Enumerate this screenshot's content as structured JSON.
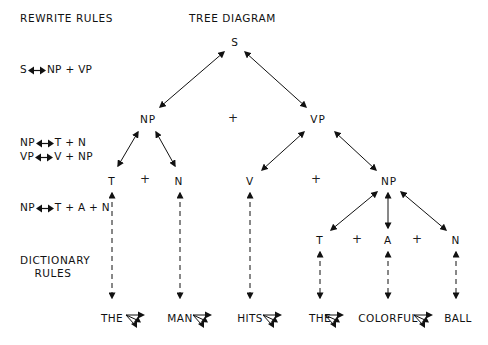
{
  "headers": {
    "rewrite_rules": "REWRITE RULES",
    "tree_diagram": "TREE DIAGRAM",
    "dictionary_rules_line1": "DICTIONARY",
    "dictionary_rules_line2": "RULES"
  },
  "rewrite_rules": [
    {
      "lhs": "S",
      "rhs": "NP + VP",
      "y": 70
    },
    {
      "lhs": "NP",
      "rhs": "T + N",
      "y": 143
    },
    {
      "lhs": "VP",
      "rhs": "V + NP",
      "y": 157
    },
    {
      "lhs": "NP",
      "rhs": "T + A + N",
      "y": 208
    }
  ],
  "tree": {
    "nodes": [
      {
        "id": "S",
        "label": "S",
        "x": 235,
        "y": 42
      },
      {
        "id": "NP1",
        "label": "NP",
        "x": 148,
        "y": 119
      },
      {
        "id": "VP",
        "label": "VP",
        "x": 318,
        "y": 119
      },
      {
        "id": "T1",
        "label": "T",
        "x": 112,
        "y": 181
      },
      {
        "id": "N1",
        "label": "N",
        "x": 179,
        "y": 181
      },
      {
        "id": "V",
        "label": "V",
        "x": 250,
        "y": 181
      },
      {
        "id": "NP2",
        "label": "NP",
        "x": 389,
        "y": 181
      },
      {
        "id": "T2",
        "label": "T",
        "x": 320,
        "y": 240
      },
      {
        "id": "A",
        "label": "A",
        "x": 388,
        "y": 240
      },
      {
        "id": "N2",
        "label": "N",
        "x": 456,
        "y": 240
      }
    ],
    "pluses": [
      {
        "x": 233,
        "y": 118
      },
      {
        "x": 145,
        "y": 179
      },
      {
        "x": 316,
        "y": 179
      },
      {
        "x": 357,
        "y": 239
      },
      {
        "x": 417,
        "y": 239
      }
    ],
    "edges": [
      {
        "x1": 224,
        "y1": 52,
        "x2": 160,
        "y2": 107
      },
      {
        "x1": 245,
        "y1": 52,
        "x2": 306,
        "y2": 107
      },
      {
        "x1": 138,
        "y1": 132,
        "x2": 118,
        "y2": 166
      },
      {
        "x1": 156,
        "y1": 132,
        "x2": 175,
        "y2": 166
      },
      {
        "x1": 304,
        "y1": 132,
        "x2": 262,
        "y2": 170
      },
      {
        "x1": 335,
        "y1": 132,
        "x2": 376,
        "y2": 170
      },
      {
        "x1": 377,
        "y1": 192,
        "x2": 331,
        "y2": 230
      },
      {
        "x1": 388,
        "y1": 193,
        "x2": 388,
        "y2": 228
      },
      {
        "x1": 401,
        "y1": 192,
        "x2": 446,
        "y2": 230
      }
    ],
    "dashed_edges": [
      {
        "x": 112,
        "y1": 193,
        "y2": 298
      },
      {
        "x": 180,
        "y1": 193,
        "y2": 298
      },
      {
        "x": 250,
        "y1": 193,
        "y2": 298
      },
      {
        "x": 320,
        "y1": 252,
        "y2": 298
      },
      {
        "x": 388,
        "y1": 252,
        "y2": 298
      },
      {
        "x": 456,
        "y1": 252,
        "y2": 298
      }
    ]
  },
  "sentence": {
    "words": [
      {
        "text": "THE",
        "x": 112,
        "y": 318
      },
      {
        "text": "MAN",
        "x": 180,
        "y": 318
      },
      {
        "text": "HITS",
        "x": 250,
        "y": 318
      },
      {
        "text": "THE",
        "x": 320,
        "y": 318
      },
      {
        "text": "COLORFUL",
        "x": 388,
        "y": 318
      },
      {
        "text": "BALL",
        "x": 458,
        "y": 318
      }
    ],
    "triple_arrows": [
      {
        "x": 135,
        "y": 318
      },
      {
        "x": 202,
        "y": 318
      },
      {
        "x": 272,
        "y": 318
      },
      {
        "x": 334,
        "y": 318
      },
      {
        "x": 423,
        "y": 318
      }
    ]
  },
  "colors": {
    "ink": "#111111",
    "background": "#ffffff"
  }
}
